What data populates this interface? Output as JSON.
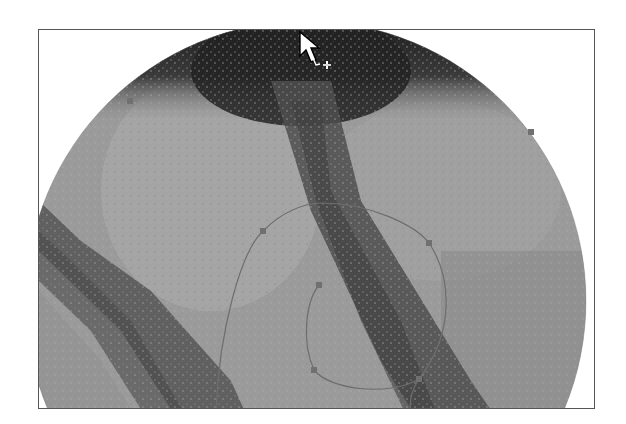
{
  "canvas": {
    "label": "Image editing canvas",
    "background": "#ffffff",
    "border_color": "#555555"
  },
  "image": {
    "description": "Grayscale circular clip of textured image with dark diagonal bands",
    "base_gray": "#9a9a9a",
    "dark_band_color": "#2a2a2a"
  },
  "path": {
    "stroke_color": "#6e6e6e",
    "anchor_color": "#707070",
    "anchor_points": [
      {
        "x": 129,
        "y": 100
      },
      {
        "x": 530,
        "y": 131
      },
      {
        "x": 262,
        "y": 230
      },
      {
        "x": 428,
        "y": 242
      },
      {
        "x": 318,
        "y": 284
      },
      {
        "x": 313,
        "y": 369
      },
      {
        "x": 418,
        "y": 378
      }
    ]
  },
  "cursor": {
    "icon": "arrow-add-anchor-icon",
    "modifier": "+"
  }
}
